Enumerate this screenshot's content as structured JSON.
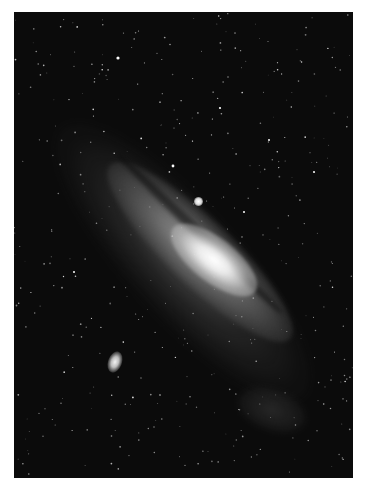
{
  "image": {
    "subject": "Spiral galaxy with two satellite galaxies against a dense starfield",
    "palette": {
      "background": "#0b0b0b",
      "page": "#ffffff",
      "core": "#ffffff",
      "arms": "#8c8c8c"
    },
    "frame": {
      "left": 14,
      "top": 12,
      "width": 339,
      "height": 466
    },
    "features": [
      {
        "name": "galaxy-core",
        "cx": 200,
        "cy": 248
      },
      {
        "name": "satellite-upper",
        "cx": 184,
        "cy": 189
      },
      {
        "name": "satellite-lower",
        "cx": 101,
        "cy": 350
      }
    ],
    "star_count": 420,
    "bright_stars": [
      {
        "x": 104,
        "y": 46,
        "r": 1.6
      },
      {
        "x": 159,
        "y": 154,
        "r": 1.4
      },
      {
        "x": 206,
        "y": 96,
        "r": 1.1
      },
      {
        "x": 255,
        "y": 128,
        "r": 1.0
      },
      {
        "x": 300,
        "y": 160,
        "r": 1.0
      },
      {
        "x": 60,
        "y": 260,
        "r": 1.0
      },
      {
        "x": 230,
        "y": 200,
        "r": 1.0
      }
    ]
  }
}
